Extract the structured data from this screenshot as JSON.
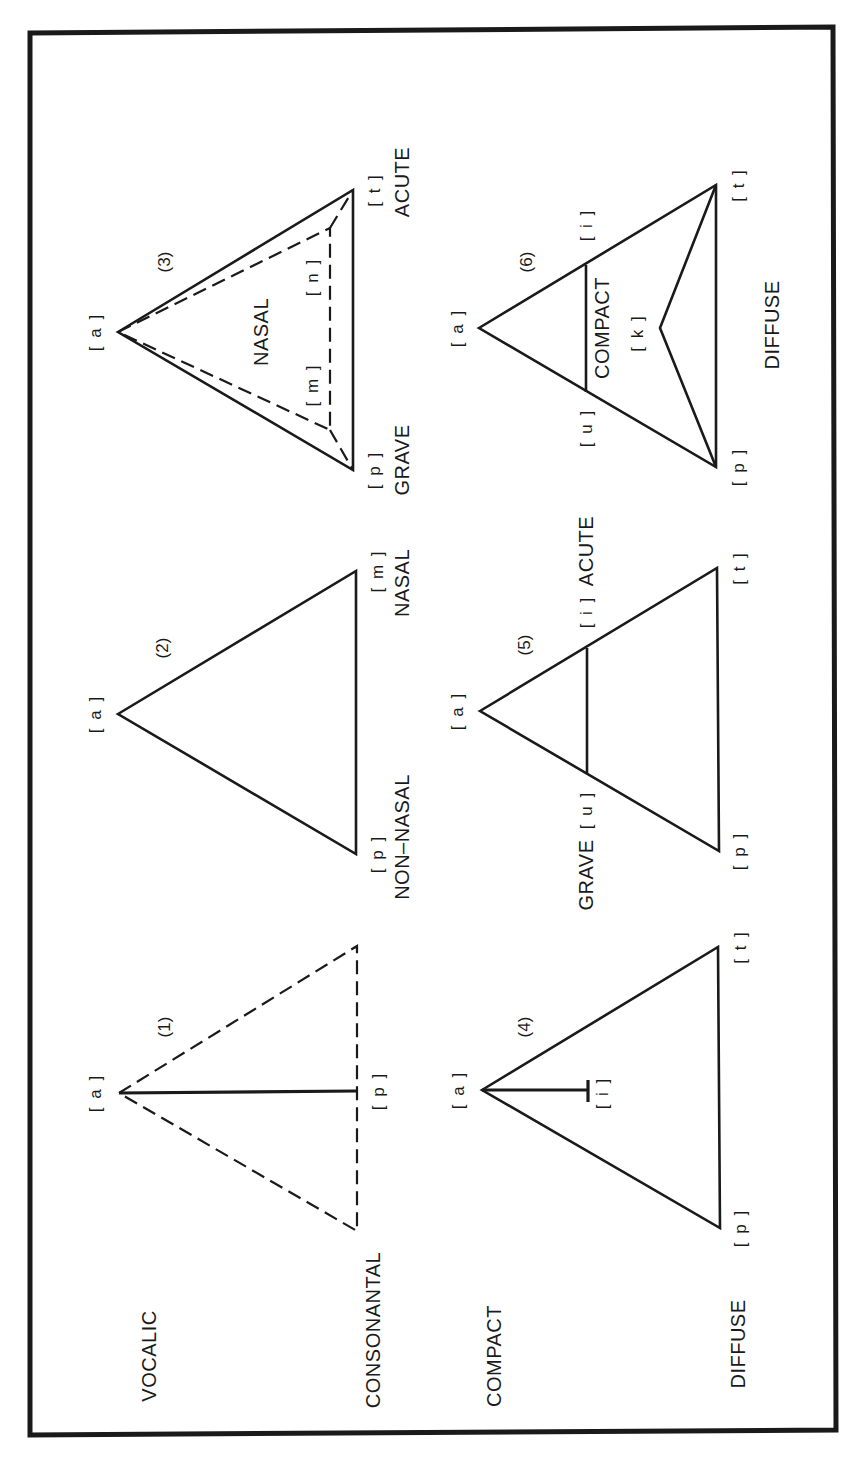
{
  "figure": {
    "orientation": "rotated -90deg (text reads bottom-to-top)",
    "colors": {
      "ink": "#1a1a1a",
      "background": "#ffffff"
    },
    "diagrams": [
      {
        "number": "(1)",
        "left_label": "VOCALIC",
        "right_label": "CONSONANTAL",
        "apex": "[ a ]",
        "base_mid": "[ p ]",
        "style": "dashed triangle with solid median"
      },
      {
        "number": "(2)",
        "left_label": "NON–NASAL",
        "right_label": "NASAL",
        "apex": "[ a ]",
        "base_left": "[ p ]",
        "base_right": "[ m ]"
      },
      {
        "number": "(3)",
        "inner_label": "NASAL",
        "left_label": "GRAVE",
        "right_label": "ACUTE",
        "apex": "[ a ]",
        "base_left": "[ p ]",
        "base_right": "[ t ]",
        "inner_left": "[ m ]",
        "inner_right": "[ n ]"
      },
      {
        "number": "(4)",
        "left_label": "COMPACT",
        "right_label": "DIFFUSE",
        "apex": "[ a ]",
        "stem": "[ i ]",
        "base_left": "[ p ]",
        "base_right": "[ t ]"
      },
      {
        "number": "(5)",
        "left_label": "GRAVE",
        "right_label": "ACUTE",
        "apex": "[ a ]",
        "side_left": "[ u ]",
        "side_right": "[ i ]",
        "base_left": "[ p ]",
        "base_right": "[ t ]"
      },
      {
        "number": "(6)",
        "inner_label": "COMPACT",
        "bottom_label": "DIFFUSE",
        "apex": "[ a ]",
        "side_left": "[ u ]",
        "side_right": "[ i ]",
        "inner_point": "[ k ]",
        "base_left": "[ p ]",
        "base_right": "[ t ]"
      }
    ]
  }
}
